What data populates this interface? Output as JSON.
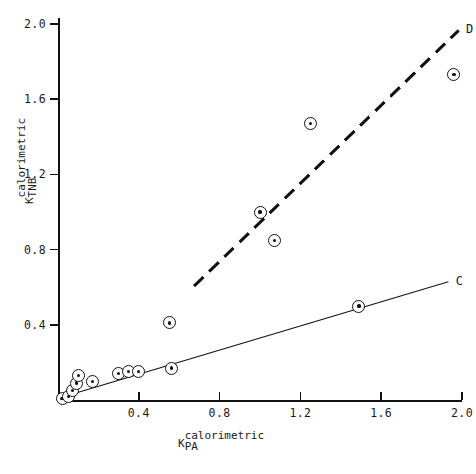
{
  "chart_data": {
    "type": "scatter",
    "title": "",
    "xlabel": "K calorimetric PA",
    "xlabel_symbol": "K",
    "xlabel_superscript": "calorimetric",
    "xlabel_subscript": "PA",
    "ylabel": "K calorimetric TNB",
    "ylabel_symbol": "K",
    "ylabel_superscript": "calorimetric",
    "ylabel_subscript": "TNB",
    "xlim": [
      0.0,
      2.1
    ],
    "ylim": [
      0.0,
      2.1
    ],
    "xticks": [
      0.4,
      0.8,
      1.2,
      1.6,
      2.0
    ],
    "ytickbase": [
      0.4,
      0.8,
      1.2,
      1.6,
      2.0
    ],
    "xtick_labels": [
      "0.4",
      "0.8",
      "1.2",
      "1.6",
      "2.0"
    ],
    "ytick_labels": [
      "0.4",
      "0.8",
      "1.2",
      "1.6",
      "2.0"
    ],
    "grid": false,
    "legend_position": "inline-end-of-line",
    "points": [
      {
        "x": 0.02,
        "y": 0.01
      },
      {
        "x": 0.05,
        "y": 0.02
      },
      {
        "x": 0.07,
        "y": 0.05
      },
      {
        "x": 0.09,
        "y": 0.09
      },
      {
        "x": 0.1,
        "y": 0.13
      },
      {
        "x": 0.17,
        "y": 0.1
      },
      {
        "x": 0.3,
        "y": 0.14
      },
      {
        "x": 0.35,
        "y": 0.15
      },
      {
        "x": 0.4,
        "y": 0.15
      },
      {
        "x": 0.55,
        "y": 0.41
      },
      {
        "x": 0.56,
        "y": 0.17
      },
      {
        "x": 1.0,
        "y": 1.0
      },
      {
        "x": 1.07,
        "y": 0.85
      },
      {
        "x": 1.25,
        "y": 1.47
      },
      {
        "x": 1.49,
        "y": 0.5
      },
      {
        "x": 1.96,
        "y": 1.73
      }
    ],
    "series": [
      {
        "name": "C",
        "label": "C",
        "style": "solid",
        "x_start": 0.03,
        "y_start": 0.02,
        "x_end": 1.93,
        "y_end": 0.63
      },
      {
        "name": "D",
        "label": "D",
        "style": "dashed",
        "x_start": 0.67,
        "y_start": 0.61,
        "x_end": 1.98,
        "y_end": 1.97
      }
    ]
  },
  "axes": {
    "y_label_top": "calorimetric",
    "y_label_sym": "K",
    "y_label_sub": "TNB",
    "x_label_top": "calorimetric",
    "x_label_sym": "K",
    "x_label_sub": "PA"
  }
}
